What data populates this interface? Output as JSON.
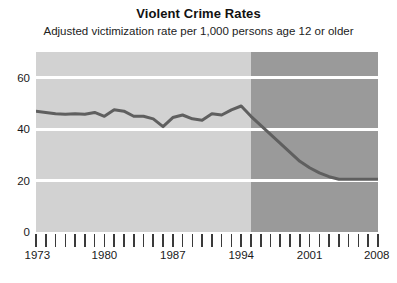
{
  "chart_data": {
    "type": "line",
    "title": "Violent Crime Rates",
    "subtitle": "Adjusted victimization rate per 1,000 persons age 12 or older",
    "xlabel": "",
    "ylabel": "",
    "xlim": [
      1973,
      2008
    ],
    "ylim": [
      0,
      70
    ],
    "yticks": [
      0,
      20,
      40,
      60
    ],
    "ytick_labels": [
      "0",
      "20",
      "40",
      "60"
    ],
    "xticks": [
      1973,
      1974,
      1975,
      1976,
      1977,
      1978,
      1979,
      1980,
      1981,
      1982,
      1983,
      1984,
      1985,
      1986,
      1987,
      1988,
      1989,
      1990,
      1991,
      1992,
      1993,
      1994,
      1995,
      1996,
      1997,
      1998,
      1999,
      2000,
      2001,
      2002,
      2003,
      2004,
      2005,
      2006,
      2007,
      2008
    ],
    "xtick_labels_shown": [
      "1973",
      "1980",
      "1987",
      "1994",
      "2001",
      "2008"
    ],
    "xtick_labels_years": [
      1973,
      1980,
      1987,
      1994,
      2001,
      2008
    ],
    "grid": "horizontal-white",
    "legend": "none",
    "series": [
      {
        "name": "Adjusted victimization rate",
        "color": "#5f5f5f",
        "x": [
          1973,
          1974,
          1975,
          1976,
          1977,
          1978,
          1979,
          1980,
          1981,
          1982,
          1983,
          1984,
          1985,
          1986,
          1987,
          1988,
          1989,
          1990,
          1991,
          1992,
          1993,
          1994,
          1995,
          1996,
          1997,
          1998,
          1999,
          2000,
          2001,
          2002,
          2003,
          2004,
          2005,
          2006,
          2007,
          2008
        ],
        "values": [
          47.0,
          46.5,
          46.0,
          45.8,
          46.0,
          45.8,
          46.5,
          45.0,
          47.5,
          47.0,
          45.0,
          45.0,
          44.0,
          41.0,
          44.5,
          45.5,
          44.0,
          43.5,
          46.0,
          45.5,
          47.5,
          49.0,
          45.0,
          41.5,
          38.0,
          34.5,
          31.0,
          27.5,
          25.0,
          23.0,
          21.5,
          20.5,
          20.5,
          20.5,
          20.5,
          20.5
        ]
      }
    ],
    "shaded_regions": [
      {
        "name": "early-period",
        "from": 1973,
        "to": 1995,
        "color": "#d2d2d2"
      },
      {
        "name": "late-period",
        "from": 1995,
        "to": 2008,
        "color": "#9a9a9a"
      }
    ]
  }
}
